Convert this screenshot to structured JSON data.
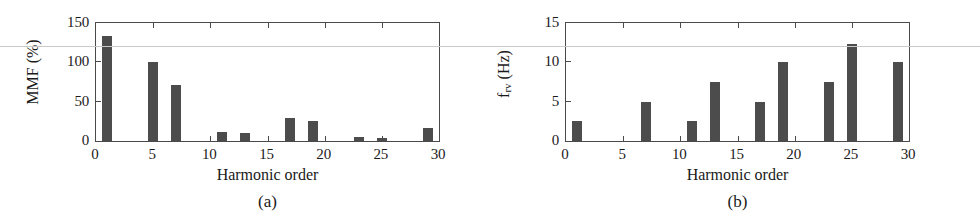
{
  "figure": {
    "panels": [
      {
        "caption": "(a)",
        "chart_data": {
          "type": "bar",
          "title": "",
          "xlabel": "Harmonic order",
          "ylabel": "MMF (%)",
          "xlim": [
            0,
            30
          ],
          "ylim": [
            0,
            150
          ],
          "xticks": [
            0,
            5,
            10,
            15,
            20,
            25,
            30
          ],
          "xticklabels": [
            "0",
            "5",
            "10",
            "15",
            "20",
            "25",
            "30"
          ],
          "yticks": [
            0,
            50,
            100,
            150
          ],
          "yticklabels": [
            "0",
            "50",
            "100",
            "150"
          ],
          "grid": false,
          "legend": "none",
          "bar_color": "#4c4c4c",
          "categories": [
            1,
            5,
            7,
            11,
            13,
            17,
            19,
            23,
            25,
            29
          ],
          "values": [
            134,
            100,
            71,
            12,
            10,
            29,
            26,
            5,
            4,
            16
          ]
        }
      },
      {
        "caption": "(b)",
        "chart_data": {
          "type": "bar",
          "title": "",
          "xlabel": "Harmonic order",
          "ylabel_main": "f",
          "ylabel_sub": "rv",
          "ylabel_unit": " (Hz)",
          "ylabel": "f_rv (Hz)",
          "xlim": [
            0,
            30
          ],
          "ylim": [
            0,
            15
          ],
          "xticks": [
            0,
            5,
            10,
            15,
            20,
            25,
            30
          ],
          "xticklabels": [
            "0",
            "5",
            "10",
            "15",
            "20",
            "25",
            "30"
          ],
          "yticks": [
            0,
            5,
            10,
            15
          ],
          "yticklabels": [
            "0",
            "5",
            "10",
            "15"
          ],
          "grid": false,
          "legend": "none",
          "bar_color": "#4c4c4c",
          "categories": [
            1,
            7,
            11,
            13,
            17,
            19,
            23,
            25,
            29
          ],
          "values": [
            2.5,
            5.0,
            2.5,
            7.5,
            5.0,
            10.0,
            7.5,
            12.3,
            10.0
          ]
        }
      }
    ]
  }
}
